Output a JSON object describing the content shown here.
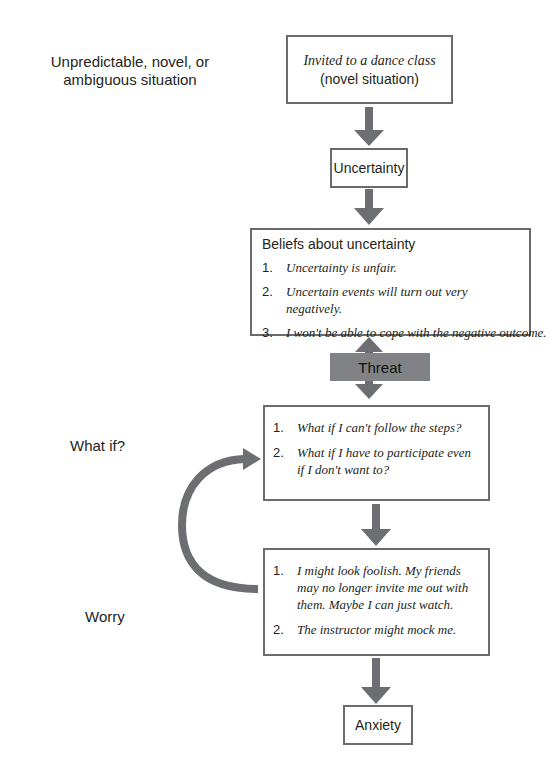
{
  "side_labels": {
    "trigger": "Unpredictable, novel, or ambiguous situation",
    "trigger_line1": "Unpredictable, novel, or",
    "trigger_line2": "ambiguous situation",
    "what_if": "What if?",
    "worry": "Worry"
  },
  "nodes": {
    "situation": {
      "line1": "Invited to a dance class",
      "line2": "(novel situation)"
    },
    "uncertainty": {
      "label": "Uncertainty"
    },
    "beliefs": {
      "title": "Beliefs about uncertainty",
      "items": [
        {
          "num": "1.",
          "text": "Uncertainty is unfair."
        },
        {
          "num": "2.",
          "text": "Uncertain events will turn out very negatively."
        },
        {
          "num": "3.",
          "text": "I won't be able to cope with the negative outcome."
        }
      ]
    },
    "threat": {
      "label": "Threat"
    },
    "what_if": {
      "items": [
        {
          "num": "1.",
          "text": "What if I can't follow the steps?"
        },
        {
          "num": "2.",
          "text": "What if I have to participate even if I don't want to?"
        }
      ]
    },
    "worry": {
      "items": [
        {
          "num": "1.",
          "text": "I might look foolish. My friends may no longer invite me out with them. Maybe I can just watch."
        },
        {
          "num": "2.",
          "text": "The instructor might mock me."
        }
      ]
    },
    "anxiety": {
      "label": "Anxiety"
    }
  },
  "colors": {
    "arrow": "#6d6e71",
    "box_border": "#6b6b6b",
    "threat_fill": "#808285",
    "text": "#231f20"
  }
}
